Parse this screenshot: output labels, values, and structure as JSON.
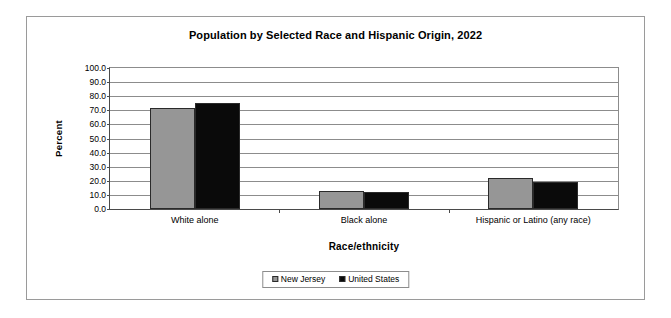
{
  "chart_data": {
    "type": "bar",
    "title": "Population by Selected Race and Hispanic Origin, 2022",
    "xlabel": "Race/ethnicity",
    "ylabel": "Percent",
    "categories": [
      "White alone",
      "Black alone",
      "Hispanic or Latino (any race)"
    ],
    "series": [
      {
        "name": "New Jersey",
        "color": "#969696",
        "values": [
          71.5,
          13.0,
          22.0
        ]
      },
      {
        "name": "United States",
        "color": "#0a0a0a",
        "values": [
          75.5,
          12.0,
          19.0
        ]
      }
    ],
    "ylim": [
      0,
      100
    ],
    "ytick_labels": [
      "100.0",
      "90.0",
      "80.0",
      "70.0",
      "60.0",
      "50.0",
      "40.0",
      "30.0",
      "20.0",
      "10.0",
      "0.0"
    ],
    "ytick_values": [
      100,
      90,
      80,
      70,
      60,
      50,
      40,
      30,
      20,
      10,
      0
    ],
    "grid": true,
    "legend_position": "bottom"
  }
}
